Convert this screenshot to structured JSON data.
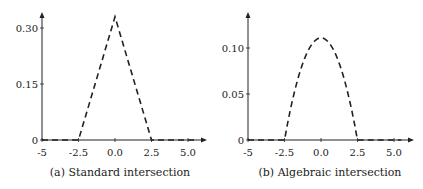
{
  "chart_data": [
    {
      "type": "line",
      "caption": "(a) Standard intersection",
      "xlim": [
        -5,
        5.5
      ],
      "ylim": [
        0,
        0.35
      ],
      "xticks": [
        -5,
        -2.5,
        0,
        2.5,
        5
      ],
      "xtick_labels": [
        "-5",
        "-2.5",
        "0.0",
        "2.5",
        "5.0"
      ],
      "yticks": [
        0,
        0.15,
        0.3
      ],
      "ytick_labels": [
        "0",
        "0.15",
        "0.30"
      ],
      "grid": false,
      "series": [
        {
          "name": "standard",
          "style": "dashed",
          "x": [
            -5,
            -2.5,
            0,
            2.5,
            5.5
          ],
          "y": [
            0,
            0,
            0.33,
            0,
            0
          ]
        }
      ]
    },
    {
      "type": "line",
      "caption": "(b) Algebraic intersection",
      "xlim": [
        -5,
        5.5
      ],
      "ylim": [
        0,
        0.14
      ],
      "xticks": [
        -5,
        -2.5,
        0,
        2.5,
        5
      ],
      "xtick_labels": [
        "-5",
        "-2.5",
        "0.0",
        "2.5",
        "5.0"
      ],
      "yticks": [
        0,
        0.05,
        0.1
      ],
      "ytick_labels": [
        "0",
        "0.05",
        "0.10"
      ],
      "grid": false,
      "series": [
        {
          "name": "algebraic",
          "style": "dashed",
          "x": [
            -5,
            -2.5,
            -2.0,
            -1.5,
            -1.0,
            -0.5,
            0,
            0.5,
            1.0,
            1.5,
            2.0,
            2.5,
            5.5
          ],
          "y": [
            0,
            0,
            0.04,
            0.07,
            0.093,
            0.106,
            0.111,
            0.106,
            0.093,
            0.07,
            0.04,
            0,
            0
          ]
        }
      ]
    }
  ]
}
